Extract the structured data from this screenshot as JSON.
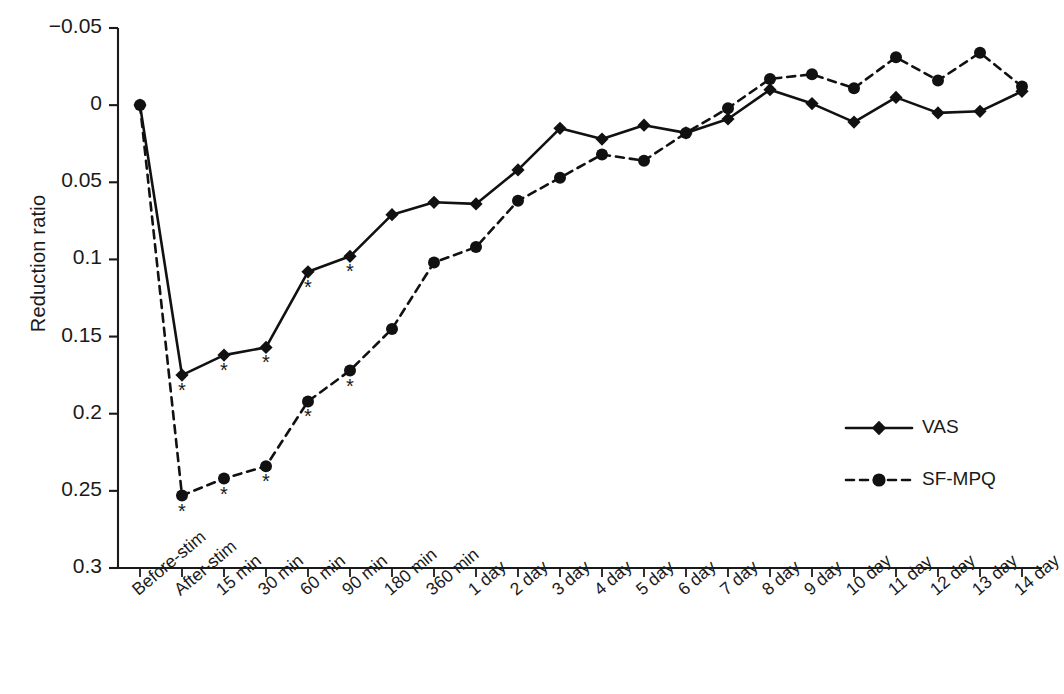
{
  "chart_data": {
    "type": "line",
    "title": "",
    "xlabel": "",
    "ylabel": "Reduction ratio",
    "ylim": [
      -0.05,
      0.3
    ],
    "y_inverted": true,
    "grid": false,
    "legend_position": "right-middle",
    "y_ticks": [
      "−0.05",
      "0",
      "0.05",
      "0.1",
      "0.15",
      "0.2",
      "0.25",
      "0.3"
    ],
    "y_tick_values": [
      -0.05,
      0,
      0.05,
      0.1,
      0.15,
      0.2,
      0.25,
      0.3
    ],
    "categories": [
      "Before-stim",
      "After-stim",
      "15 min",
      "30 min",
      "60 min",
      "90 min",
      "180 min",
      "360 min",
      "1 day",
      "2 day",
      "3 day",
      "4 day",
      "5 day",
      "6 day",
      "7 day",
      "8 day",
      "9 day",
      "10 day",
      "11 day",
      "12 day",
      "13 day",
      "14 day"
    ],
    "series": [
      {
        "name": "VAS",
        "marker": "diamond",
        "line_style": "solid",
        "color": "#111111",
        "values": [
          0.0,
          0.175,
          0.162,
          0.157,
          0.108,
          0.098,
          0.071,
          0.063,
          0.064,
          0.042,
          0.015,
          0.022,
          0.013,
          0.018,
          0.009,
          -0.01,
          -0.001,
          0.011,
          -0.005,
          0.005,
          0.004,
          -0.009
        ],
        "significance": [
          false,
          true,
          true,
          true,
          true,
          true,
          false,
          false,
          false,
          false,
          false,
          false,
          false,
          false,
          false,
          false,
          false,
          false,
          false,
          false,
          false,
          false
        ]
      },
      {
        "name": "SF-MPQ",
        "marker": "circle",
        "line_style": "dashed",
        "color": "#111111",
        "values": [
          0.0,
          0.253,
          0.242,
          0.234,
          0.192,
          0.172,
          0.145,
          0.102,
          0.092,
          0.062,
          0.047,
          0.032,
          0.036,
          0.018,
          0.002,
          -0.017,
          -0.02,
          -0.011,
          -0.031,
          -0.016,
          -0.034,
          -0.012
        ],
        "significance": [
          false,
          true,
          true,
          true,
          true,
          true,
          false,
          false,
          false,
          false,
          false,
          false,
          false,
          false,
          false,
          false,
          false,
          false,
          false,
          false,
          false,
          false
        ]
      }
    ],
    "significance_glyph": "*"
  },
  "legend": {
    "items": [
      {
        "label": "VAS"
      },
      {
        "label": "SF-MPQ"
      }
    ]
  }
}
